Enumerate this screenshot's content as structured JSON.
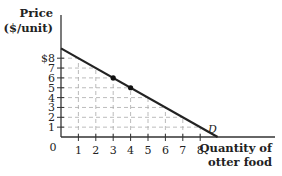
{
  "chart_data": {
    "type": "line",
    "title": "",
    "ylabel_line1": "Price",
    "ylabel_line2": "($/unit)",
    "xlabel_line1": "Quantity of",
    "xlabel_line2": "otter food",
    "origin_label": "0",
    "x_ticks": [
      "1",
      "2",
      "3",
      "4",
      "5",
      "6",
      "7",
      "8"
    ],
    "y_ticks": [
      "1",
      "2",
      "3",
      "4",
      "5",
      "6",
      "7",
      "$8"
    ],
    "xlim": [
      0,
      12
    ],
    "ylim": [
      0,
      12
    ],
    "grid": "dashed",
    "series": [
      {
        "name": "D",
        "label": "D",
        "x": [
          0,
          9
        ],
        "y": [
          9,
          0
        ],
        "color": "#222222"
      }
    ],
    "points": [
      {
        "x": 3,
        "y": 6
      },
      {
        "x": 4,
        "y": 5
      }
    ],
    "curve_label": "D"
  }
}
